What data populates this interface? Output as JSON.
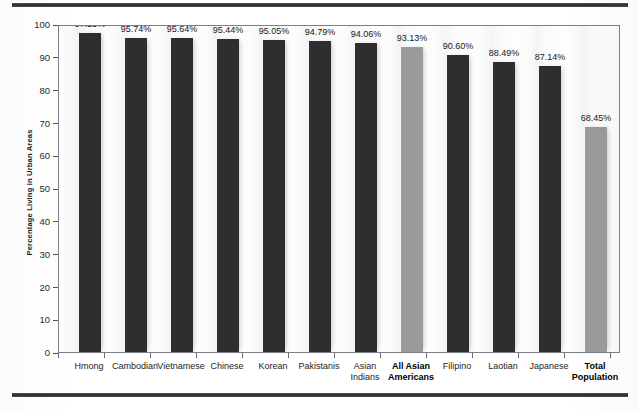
{
  "figure": {
    "name": "percentage-living-in-urban-areas-bar-chart"
  },
  "axes": {
    "y_title": "Percentage Living in Urban Areas",
    "y_ticks": [
      "100",
      "90",
      "80",
      "70",
      "60",
      "50",
      "40",
      "30",
      "20",
      "10",
      "0"
    ]
  },
  "colors": {
    "bar_default": "#2e2e2e",
    "bar_highlight": "#9b9b9b",
    "frame": "#7d7d85",
    "rule": "#2b2b2b"
  },
  "chart_data": {
    "type": "bar",
    "title": "",
    "xlabel": "",
    "ylabel": "Percentage Living in Urban Areas",
    "ylim": [
      0,
      100
    ],
    "ytick_step": 10,
    "grid": false,
    "legend": "none",
    "categories": [
      "Hmong",
      "Cambodian",
      "Vietnamese",
      "Chinese",
      "Korean",
      "Pakistanis",
      "Asian Indians",
      "All Asian Americans",
      "Filipino",
      "Laotian",
      "Japanese",
      "Total Population"
    ],
    "values": [
      97.25,
      95.74,
      95.64,
      95.44,
      95.05,
      94.79,
      94.06,
      93.13,
      90.6,
      88.49,
      87.14,
      68.45
    ],
    "data_labels": [
      "97.25%",
      "95.74%",
      "95.64%",
      "95.44%",
      "95.05%",
      "94.79%",
      "94.06%",
      "93.13%",
      "90.60%",
      "88.49%",
      "87.14%",
      "68.45%"
    ],
    "bars": [
      {
        "label_line1": "Hmong",
        "label_line2": "",
        "value": 97.25,
        "data_label": "97.25%",
        "highlight": false,
        "bold": false
      },
      {
        "label_line1": "Cambodian",
        "label_line2": "",
        "value": 95.74,
        "data_label": "95.74%",
        "highlight": false,
        "bold": false
      },
      {
        "label_line1": "Vietnamese",
        "label_line2": "",
        "value": 95.64,
        "data_label": "95.64%",
        "highlight": false,
        "bold": false
      },
      {
        "label_line1": "Chinese",
        "label_line2": "",
        "value": 95.44,
        "data_label": "95.44%",
        "highlight": false,
        "bold": false
      },
      {
        "label_line1": "Korean",
        "label_line2": "",
        "value": 95.05,
        "data_label": "95.05%",
        "highlight": false,
        "bold": false
      },
      {
        "label_line1": "Pakistanis",
        "label_line2": "",
        "value": 94.79,
        "data_label": "94.79%",
        "highlight": false,
        "bold": false
      },
      {
        "label_line1": "Asian",
        "label_line2": "Indians",
        "value": 94.06,
        "data_label": "94.06%",
        "highlight": false,
        "bold": false
      },
      {
        "label_line1": "All Asian",
        "label_line2": "Americans",
        "value": 93.13,
        "data_label": "93.13%",
        "highlight": true,
        "bold": true
      },
      {
        "label_line1": "Filipino",
        "label_line2": "",
        "value": 90.6,
        "data_label": "90.60%",
        "highlight": false,
        "bold": false
      },
      {
        "label_line1": "Laotian",
        "label_line2": "",
        "value": 88.49,
        "data_label": "88.49%",
        "highlight": false,
        "bold": false
      },
      {
        "label_line1": "Japanese",
        "label_line2": "",
        "value": 87.14,
        "data_label": "87.14%",
        "highlight": false,
        "bold": false
      },
      {
        "label_line1": "Total",
        "label_line2": "Population",
        "value": 68.45,
        "data_label": "68.45%",
        "highlight": true,
        "bold": true
      }
    ]
  }
}
